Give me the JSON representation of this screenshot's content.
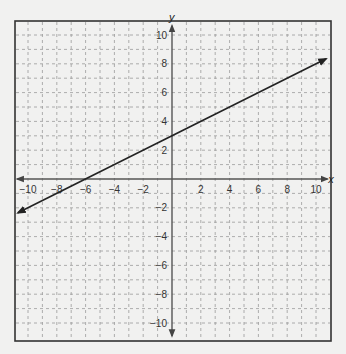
{
  "chart_data": {
    "type": "line",
    "title": "",
    "xlabel": "x",
    "ylabel": "y",
    "xlim": [
      -10.5,
      10.5
    ],
    "ylim": [
      -10.5,
      10.5
    ],
    "grid": true,
    "grid_style": "dashed",
    "x_ticks": [
      -10,
      -8,
      -6,
      -4,
      -2,
      2,
      4,
      6,
      8,
      10
    ],
    "y_ticks": [
      -10,
      -8,
      -6,
      -4,
      -2,
      2,
      4,
      6,
      8,
      10
    ],
    "x_tick_labels": [
      "−10",
      "−8",
      "−6",
      "−4",
      "−2",
      "2",
      "4",
      "6",
      "8",
      "10"
    ],
    "y_tick_labels": [
      "−10",
      "−8",
      "−6",
      "−4",
      "−2",
      "2",
      "4",
      "6",
      "8",
      "10"
    ],
    "series": [
      {
        "name": "line",
        "equation": "y = 0.5x + 3",
        "slope": 0.5,
        "intercept": 3,
        "x": [
          -10.7,
          10.7
        ],
        "y": [
          -2.35,
          8.35
        ],
        "arrows": "both"
      }
    ],
    "key_points": [
      {
        "label": "x-intercept",
        "x": -6,
        "y": 0
      },
      {
        "label": "y-intercept",
        "x": 0,
        "y": 3
      }
    ],
    "colors": {
      "background": "#f1f1f0",
      "frame": "#333333",
      "grid": "#9a9a9a",
      "axis": "#555555",
      "line": "#222222"
    }
  }
}
